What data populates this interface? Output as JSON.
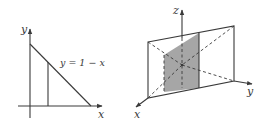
{
  "left_figure": {
    "axis_labels": {
      "x": "x",
      "y": "y"
    },
    "curve_label": "y = 1 − x",
    "colors": {
      "stroke": "#3a3a3a"
    }
  },
  "right_figure": {
    "axis_labels": {
      "x": "x",
      "y": "y",
      "z": "z"
    },
    "colors": {
      "stroke": "#3a3a3a",
      "shade": "#a6a6a6"
    }
  }
}
